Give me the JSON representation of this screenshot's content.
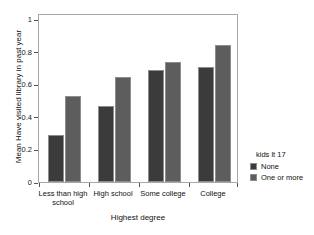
{
  "chart_data": {
    "type": "bar",
    "title": "",
    "subtitle": "",
    "categories": [
      "Less than high school",
      "High school",
      "Some college",
      "College"
    ],
    "series": [
      {
        "name": "None",
        "values": [
          0.28,
          0.45,
          0.66,
          0.68
        ],
        "color": "#3b3b3b"
      },
      {
        "name": "One or more",
        "values": [
          0.51,
          0.62,
          0.71,
          0.81
        ],
        "color": "#5d5d5d"
      }
    ],
    "xlabel": "Highest degree",
    "ylabel": "Mean Have visited library in past year",
    "ylim": [
      0,
      1
    ],
    "yticks": [
      0,
      0.2,
      0.4,
      0.6,
      0.8,
      1
    ],
    "ytick_labels": [
      "0",
      "0.2",
      "0.4",
      "0.6",
      "0.8",
      "1"
    ],
    "grid": false,
    "legend": {
      "title": "kids lt 17",
      "position": "right",
      "entries": [
        "None",
        "One or more"
      ]
    }
  }
}
